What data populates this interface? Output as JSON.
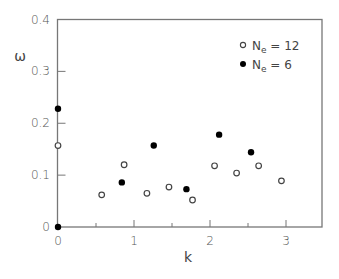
{
  "chart_data": {
    "type": "scatter",
    "title": "",
    "xlabel": "k",
    "ylabel": "ω",
    "xlim": [
      0,
      3.5
    ],
    "ylim": [
      0,
      0.4
    ],
    "xticks": [
      0,
      1,
      2,
      3
    ],
    "xtick_labels": [
      "0",
      "1",
      "2",
      "3"
    ],
    "xminor_ticks": [
      0.5,
      1.5,
      2.5
    ],
    "yticks": [
      0,
      0.1,
      0.2,
      0.3,
      0.4
    ],
    "ytick_labels": [
      "0",
      "0.1",
      "0.2",
      "0.3",
      "0.4"
    ],
    "grid": false,
    "legend_position": "upper right",
    "series": [
      {
        "name": "Ne = 12",
        "marker": "open-circle",
        "color": "#333333",
        "x": [
          0,
          0.575,
          0.87,
          1.17,
          1.46,
          1.77,
          2.06,
          2.35,
          2.64,
          2.94
        ],
        "y": [
          0.157,
          0.062,
          0.12,
          0.065,
          0.077,
          0.052,
          0.118,
          0.104,
          0.118,
          0.089
        ]
      },
      {
        "name": "Ne = 6",
        "marker": "filled-circle",
        "color": "#000000",
        "x": [
          0,
          0,
          0.84,
          1.26,
          1.69,
          2.12,
          2.54
        ],
        "y": [
          0,
          0.228,
          0.086,
          0.157,
          0.073,
          0.178,
          0.144
        ]
      }
    ]
  },
  "legend": {
    "items": [
      {
        "base": "N",
        "sub": "e",
        "rest": " = 12",
        "marker": "open-circle"
      },
      {
        "base": "N",
        "sub": "e",
        "rest": " = 6",
        "marker": "filled-circle"
      }
    ]
  }
}
